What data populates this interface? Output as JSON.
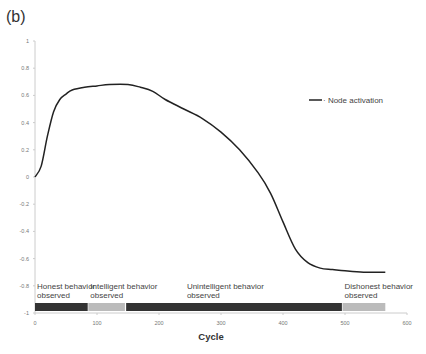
{
  "panel_label": "(b)",
  "chart_data": {
    "type": "line",
    "title": "",
    "xlabel": "Cycle",
    "ylabel": "",
    "xlim": [
      0,
      600
    ],
    "ylim": [
      -1,
      1
    ],
    "x_ticks": [
      "0",
      "100",
      "200",
      "300",
      "400",
      "500",
      "600"
    ],
    "y_ticks": [
      "1",
      "0.8",
      "0.6",
      "0.4",
      "0.2",
      "0",
      "-0.2",
      "-0.4",
      "-0.6",
      "-0.8",
      "-1"
    ],
    "grid": false,
    "legend_position": "right",
    "series": [
      {
        "name": "Node activation",
        "color": "#222222",
        "x": [
          0,
          10,
          20,
          30,
          40,
          50,
          60,
          80,
          100,
          120,
          150,
          170,
          190,
          210,
          240,
          270,
          300,
          330,
          360,
          380,
          400,
          420,
          440,
          460,
          480,
          500,
          530,
          565
        ],
        "y": [
          0,
          0.08,
          0.3,
          0.48,
          0.57,
          0.61,
          0.64,
          0.66,
          0.67,
          0.68,
          0.68,
          0.66,
          0.63,
          0.57,
          0.5,
          0.43,
          0.33,
          0.2,
          0.03,
          -0.12,
          -0.33,
          -0.53,
          -0.63,
          -0.67,
          -0.68,
          -0.69,
          -0.7,
          -0.7
        ]
      }
    ],
    "behavior_segments": [
      {
        "label_line1": "Honest behavior",
        "label_line2": "observed",
        "start": 0,
        "end": 85,
        "color": "#333333"
      },
      {
        "label_line1": "Intelligent behavior",
        "label_line2": "observed",
        "start": 86,
        "end": 145,
        "color": "#bbbbbb"
      },
      {
        "label_line1": "Unintelligent behavior",
        "label_line2": "observed",
        "start": 147,
        "end": 495,
        "color": "#333333"
      },
      {
        "label_line1": "Dishonest behavior",
        "label_line2": "observed",
        "start": 496,
        "end": 565,
        "color": "#bbbbbb"
      }
    ]
  }
}
